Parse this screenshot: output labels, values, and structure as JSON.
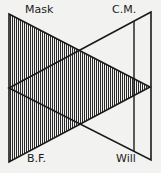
{
  "diagram": {
    "labels": {
      "top_left": "Mask",
      "top_right": "C.M.",
      "bottom_left": "B.F.",
      "bottom_right": "Will"
    },
    "colors": {
      "background": "#f2f2f0",
      "line": "#1a1a1a",
      "hatch": "#2a2a2a"
    }
  }
}
